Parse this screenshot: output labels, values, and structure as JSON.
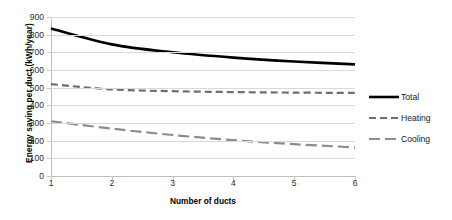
{
  "chart_data": {
    "type": "line",
    "title": "",
    "xlabel": "Number of ducts",
    "ylabel": "Energy saving per duct (kWh/year)",
    "x": [
      1,
      2,
      3,
      4,
      5,
      6
    ],
    "xlim": [
      1,
      6
    ],
    "ylim": [
      0,
      900
    ],
    "ytick_step": 100,
    "yticks": [
      0,
      100,
      200,
      300,
      400,
      500,
      600,
      700,
      800,
      900
    ],
    "xticks": [
      1,
      2,
      3,
      4,
      5,
      6
    ],
    "grid": "horizontal",
    "legend_position": "right",
    "series": [
      {
        "name": "Total",
        "values": [
          835,
          745,
          700,
          670,
          648,
          632
        ],
        "color": "#000000",
        "style": "solid",
        "width": 2.6
      },
      {
        "name": "Heating",
        "values": [
          520,
          490,
          480,
          475,
          472,
          470
        ],
        "color": "#6e6e6e",
        "style": "dashed",
        "width": 2.2
      },
      {
        "name": "Cooling",
        "values": [
          310,
          268,
          232,
          203,
          180,
          162
        ],
        "color": "#8c8c8c",
        "style": "dashdot",
        "width": 2.2
      }
    ]
  },
  "axes": {
    "y_title": "Energy saving  per duct  (kWh/year)",
    "x_title": "Number of ducts",
    "y_tick_labels": [
      "900",
      "800",
      "700",
      "600",
      "500",
      "400",
      "300",
      "200",
      "100",
      "0"
    ],
    "x_tick_labels": [
      "1",
      "2",
      "3",
      "4",
      "5",
      "6"
    ]
  },
  "legend": {
    "items": [
      {
        "label": "Total"
      },
      {
        "label": "Heating"
      },
      {
        "label": "Cooling"
      }
    ]
  }
}
